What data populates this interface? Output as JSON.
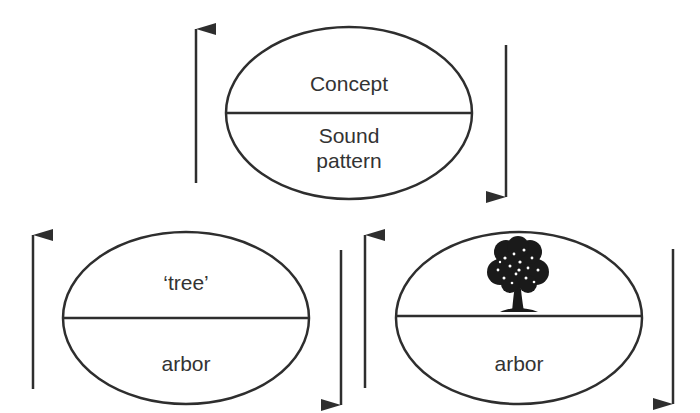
{
  "diagram": {
    "colors": {
      "stroke": "#2e2e2e",
      "text": "#333333",
      "background": "#ffffff"
    },
    "top_sign": {
      "upper_label": "Concept",
      "lower_label_line1": "Sound",
      "lower_label_line2": "pattern"
    },
    "left_sign": {
      "upper_label": "‘tree’",
      "lower_label": "arbor"
    },
    "right_sign": {
      "upper_icon": "tree-icon",
      "lower_label": "arbor"
    },
    "arrows": [
      {
        "id": "top-left",
        "direction": "up"
      },
      {
        "id": "top-right",
        "direction": "down"
      },
      {
        "id": "bottom-far-left",
        "direction": "up"
      },
      {
        "id": "bottom-middle-left",
        "direction": "down"
      },
      {
        "id": "bottom-middle-right",
        "direction": "up"
      },
      {
        "id": "bottom-far-right",
        "direction": "down"
      }
    ]
  }
}
